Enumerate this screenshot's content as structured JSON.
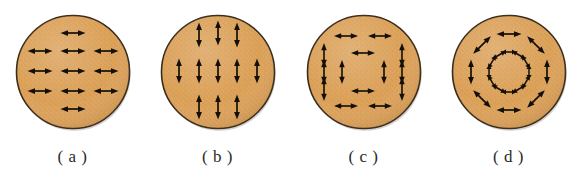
{
  "figure": {
    "width": 581,
    "height": 186,
    "background_color": "#ffffff"
  },
  "style": {
    "disc_fill_color": "#dda35b",
    "disc_fill_color_dark": "#c9883f",
    "disc_border_color": "#3a2a18",
    "arrow_color": "#141008",
    "label_color": "#2b2b2b",
    "disc_diameter_px": 113
  },
  "panels": [
    {
      "id": "a",
      "label": "( a )",
      "pattern": "uniform-horizontal",
      "arrow_orientation": "horizontal",
      "rows": [
        1,
        3,
        3,
        3,
        1
      ],
      "arrows": [
        {
          "cx": 59,
          "cy": 22,
          "angle": 0,
          "len": 25
        },
        {
          "cx": 26,
          "cy": 40,
          "angle": 0,
          "len": 25
        },
        {
          "cx": 59,
          "cy": 40,
          "angle": 0,
          "len": 25
        },
        {
          "cx": 92,
          "cy": 40,
          "angle": 0,
          "len": 25
        },
        {
          "cx": 26,
          "cy": 60,
          "angle": 0,
          "len": 25
        },
        {
          "cx": 59,
          "cy": 60,
          "angle": 0,
          "len": 25
        },
        {
          "cx": 92,
          "cy": 60,
          "angle": 0,
          "len": 25
        },
        {
          "cx": 26,
          "cy": 80,
          "angle": 0,
          "len": 25
        },
        {
          "cx": 59,
          "cy": 80,
          "angle": 0,
          "len": 25
        },
        {
          "cx": 92,
          "cy": 80,
          "angle": 0,
          "len": 25
        },
        {
          "cx": 59,
          "cy": 98,
          "angle": 0,
          "len": 25
        }
      ]
    },
    {
      "id": "b",
      "label": "( b )",
      "pattern": "uniform-vertical",
      "arrow_orientation": "vertical",
      "columns": [
        1,
        3,
        3,
        3,
        1
      ],
      "arrows": [
        {
          "cx": 59,
          "cy": 22,
          "angle": 90,
          "len": 25
        },
        {
          "cx": 40,
          "cy": 24,
          "angle": 90,
          "len": 25
        },
        {
          "cx": 78,
          "cy": 24,
          "angle": 90,
          "len": 25
        },
        {
          "cx": 20,
          "cy": 60,
          "angle": 90,
          "len": 25
        },
        {
          "cx": 40,
          "cy": 60,
          "angle": 90,
          "len": 25
        },
        {
          "cx": 59,
          "cy": 60,
          "angle": 90,
          "len": 25
        },
        {
          "cx": 78,
          "cy": 60,
          "angle": 90,
          "len": 25
        },
        {
          "cx": 98,
          "cy": 60,
          "angle": 90,
          "len": 25
        },
        {
          "cx": 40,
          "cy": 96,
          "angle": 90,
          "len": 25
        },
        {
          "cx": 59,
          "cy": 96,
          "angle": 90,
          "len": 25
        },
        {
          "cx": 78,
          "cy": 96,
          "angle": 90,
          "len": 25
        }
      ]
    },
    {
      "id": "c",
      "label": "( c )",
      "pattern": "rectangular-flux-closure",
      "arrow_orientation": "mixed",
      "arrows": [
        {
          "cx": 41,
          "cy": 25,
          "angle": 0,
          "len": 24
        },
        {
          "cx": 75,
          "cy": 25,
          "angle": 0,
          "len": 24
        },
        {
          "cx": 41,
          "cy": 95,
          "angle": 0,
          "len": 24
        },
        {
          "cx": 75,
          "cy": 95,
          "angle": 0,
          "len": 24
        },
        {
          "cx": 19,
          "cy": 44,
          "angle": 90,
          "len": 24
        },
        {
          "cx": 19,
          "cy": 61,
          "angle": 90,
          "len": 24
        },
        {
          "cx": 19,
          "cy": 78,
          "angle": 90,
          "len": 24
        },
        {
          "cx": 97,
          "cy": 44,
          "angle": 90,
          "len": 24
        },
        {
          "cx": 97,
          "cy": 61,
          "angle": 90,
          "len": 24
        },
        {
          "cx": 97,
          "cy": 78,
          "angle": 90,
          "len": 24
        },
        {
          "cx": 58,
          "cy": 42,
          "angle": 0,
          "len": 24
        },
        {
          "cx": 58,
          "cy": 80,
          "angle": 0,
          "len": 24
        },
        {
          "cx": 37,
          "cy": 61,
          "angle": 90,
          "len": 24
        },
        {
          "cx": 79,
          "cy": 61,
          "angle": 90,
          "len": 24
        }
      ]
    },
    {
      "id": "d",
      "label": "( d )",
      "pattern": "circular-vortex",
      "arrow_orientation": "tangential",
      "outer_ring_count": 8,
      "inner_ring_count": 12,
      "outer_ring_radius": 38,
      "inner_ring_radius": 20,
      "arrows": [
        {
          "cx": 59,
          "cy": 23,
          "angle": 0,
          "len": 25
        },
        {
          "cx": 86,
          "cy": 34,
          "angle": 45,
          "len": 25
        },
        {
          "cx": 97,
          "cy": 61,
          "angle": 90,
          "len": 25
        },
        {
          "cx": 86,
          "cy": 88,
          "angle": 135,
          "len": 25
        },
        {
          "cx": 59,
          "cy": 99,
          "angle": 0,
          "len": 25
        },
        {
          "cx": 32,
          "cy": 88,
          "angle": 45,
          "len": 25
        },
        {
          "cx": 21,
          "cy": 61,
          "angle": 90,
          "len": 25
        },
        {
          "cx": 32,
          "cy": 34,
          "angle": 135,
          "len": 25
        },
        {
          "cx": 59,
          "cy": 41,
          "angle": 0,
          "len": 15
        },
        {
          "cx": 69,
          "cy": 44,
          "angle": 30,
          "len": 15
        },
        {
          "cx": 76,
          "cy": 51,
          "angle": 60,
          "len": 15
        },
        {
          "cx": 79,
          "cy": 61,
          "angle": 90,
          "len": 15
        },
        {
          "cx": 76,
          "cy": 71,
          "angle": 120,
          "len": 15
        },
        {
          "cx": 69,
          "cy": 78,
          "angle": 150,
          "len": 15
        },
        {
          "cx": 59,
          "cy": 81,
          "angle": 0,
          "len": 15
        },
        {
          "cx": 49,
          "cy": 78,
          "angle": 30,
          "len": 15
        },
        {
          "cx": 42,
          "cy": 71,
          "angle": 60,
          "len": 15
        },
        {
          "cx": 39,
          "cy": 61,
          "angle": 90,
          "len": 15
        },
        {
          "cx": 42,
          "cy": 51,
          "angle": 120,
          "len": 15
        },
        {
          "cx": 49,
          "cy": 44,
          "angle": 150,
          "len": 15
        }
      ]
    }
  ]
}
